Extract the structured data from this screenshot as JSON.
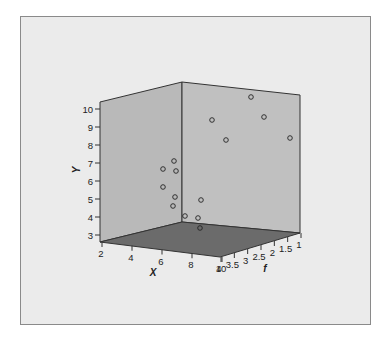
{
  "chart_data": {
    "type": "scatter3d",
    "title": "",
    "xlabel": "X",
    "ylabel": "Y",
    "zlabel": "f",
    "x_ticks": [
      "2",
      "4",
      "6",
      "8",
      "10"
    ],
    "y_ticks": [
      "3",
      "4",
      "5",
      "6",
      "7",
      "8",
      "9",
      "10"
    ],
    "z_ticks": [
      "4",
      "3.5",
      "3",
      "2.5",
      "2",
      "1.5",
      "1"
    ],
    "xlim": [
      2,
      10
    ],
    "ylim": [
      3,
      10
    ],
    "zlim": [
      1,
      4
    ],
    "grid": false,
    "legend": null,
    "note": "Points listed by approximate rendered screen position (px); true 3D coordinates not recoverable from the 2D projection.",
    "points_screen": [
      {
        "sx": 163,
        "sy": 169
      },
      {
        "sx": 174,
        "sy": 161
      },
      {
        "sx": 176,
        "sy": 171
      },
      {
        "sx": 163,
        "sy": 187
      },
      {
        "sx": 175,
        "sy": 197
      },
      {
        "sx": 173,
        "sy": 206
      },
      {
        "sx": 185,
        "sy": 216
      },
      {
        "sx": 251,
        "sy": 97
      },
      {
        "sx": 212,
        "sy": 120
      },
      {
        "sx": 264,
        "sy": 117
      },
      {
        "sx": 226,
        "sy": 140
      },
      {
        "sx": 290,
        "sy": 138
      },
      {
        "sx": 201,
        "sy": 200
      },
      {
        "sx": 198,
        "sy": 218
      },
      {
        "sx": 200,
        "sy": 228
      }
    ]
  },
  "colors": {
    "page_bg": "#ffffff",
    "frame_bg": "#ebebeb",
    "frame_border": "#8a8a8a",
    "left_wall": "#b9b9b9",
    "right_wall": "#c0c0c0",
    "floor": "#6b6b6b",
    "edge": "#333333",
    "marker": "#222222"
  }
}
